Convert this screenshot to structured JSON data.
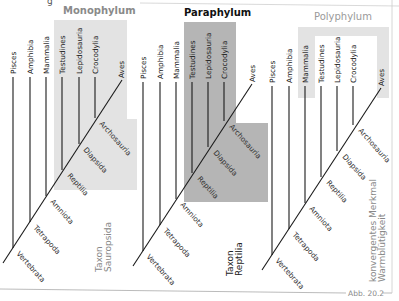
{
  "figure": {
    "caption": "Abb. 20.2",
    "top_fragment": "g",
    "colors": {
      "shade_light": "#e3e3e3",
      "shade_dark": "#b5b5b5",
      "line": "#1a1a1a",
      "title_mono": "#8a8a8a",
      "title_para": "#111111",
      "title_poly": "#9a9a9a",
      "taxon_text": "#888888"
    }
  },
  "panels": [
    {
      "title": "Monophylum",
      "leaves": [
        "Pisces",
        "Amphibia",
        "Mammalia",
        "Testudines",
        "Lepidosauria",
        "Crocodylia",
        "Aves"
      ],
      "nodes": [
        "Vertebrata",
        "Tetrapoda",
        "Amniota",
        "Reptilia",
        "Diapsida",
        "Archosauria"
      ],
      "taxon_label": [
        "Taxon",
        "Sauropsida"
      ]
    },
    {
      "title": "Paraphylum",
      "leaves": [
        "Pisces",
        "Amphibia",
        "Mammalia",
        "Testudines",
        "Lepidosauria",
        "Crocodylia",
        "Aves"
      ],
      "nodes": [
        "Vertebrata",
        "Tetrapoda",
        "Amniota",
        "Reptilia",
        "Diapsida",
        "Archosauria"
      ],
      "taxon_label": [
        "Taxon",
        "Reptilia"
      ]
    },
    {
      "title": "Polyphylum",
      "leaves": [
        "Pisces",
        "Amphibia",
        "Mammalia",
        "Testudines",
        "Lepidosauria",
        "Crocodylia",
        "Aves"
      ],
      "nodes": [
        "Vertebrata",
        "Tetrapoda",
        "Amniota",
        "Reptilia",
        "Diapsida",
        "Archosauria"
      ],
      "taxon_label": [
        "konvergentes Merkmal",
        "Warmblütigkeit"
      ]
    }
  ]
}
